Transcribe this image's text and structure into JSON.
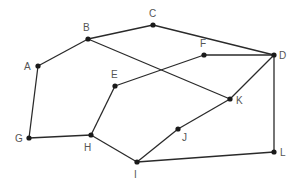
{
  "diagram": {
    "type": "graph",
    "nodes": [
      {
        "id": "A",
        "label": "A",
        "x": 38,
        "y": 66,
        "lx": 24,
        "ly": 70
      },
      {
        "id": "B",
        "label": "B",
        "x": 88,
        "y": 39,
        "lx": 83,
        "ly": 31
      },
      {
        "id": "C",
        "label": "C",
        "x": 153,
        "y": 25,
        "lx": 149,
        "ly": 17
      },
      {
        "id": "D",
        "label": "D",
        "x": 274,
        "y": 55,
        "lx": 279,
        "ly": 59
      },
      {
        "id": "E",
        "label": "E",
        "x": 115,
        "y": 86,
        "lx": 111,
        "ly": 78
      },
      {
        "id": "F",
        "label": "F",
        "x": 204,
        "y": 55,
        "lx": 200,
        "ly": 47
      },
      {
        "id": "G",
        "label": "G",
        "x": 29,
        "y": 138,
        "lx": 15,
        "ly": 142
      },
      {
        "id": "H",
        "label": "H",
        "x": 91,
        "y": 135,
        "lx": 84,
        "ly": 151
      },
      {
        "id": "I",
        "label": "I",
        "x": 137,
        "y": 162,
        "lx": 134,
        "ly": 178
      },
      {
        "id": "J",
        "label": "J",
        "x": 178,
        "y": 129,
        "lx": 182,
        "ly": 141
      },
      {
        "id": "K",
        "label": "K",
        "x": 230,
        "y": 99,
        "lx": 236,
        "ly": 104
      },
      {
        "id": "L",
        "label": "L",
        "x": 274,
        "y": 152,
        "lx": 280,
        "ly": 156
      }
    ],
    "edges": [
      [
        "A",
        "B"
      ],
      [
        "B",
        "C"
      ],
      [
        "C",
        "D"
      ],
      [
        "B",
        "K"
      ],
      [
        "A",
        "G"
      ],
      [
        "G",
        "H"
      ],
      [
        "H",
        "E"
      ],
      [
        "E",
        "F"
      ],
      [
        "F",
        "D"
      ],
      [
        "D",
        "K"
      ],
      [
        "D",
        "L"
      ],
      [
        "H",
        "I"
      ],
      [
        "I",
        "J"
      ],
      [
        "J",
        "K"
      ],
      [
        "I",
        "L"
      ]
    ]
  }
}
